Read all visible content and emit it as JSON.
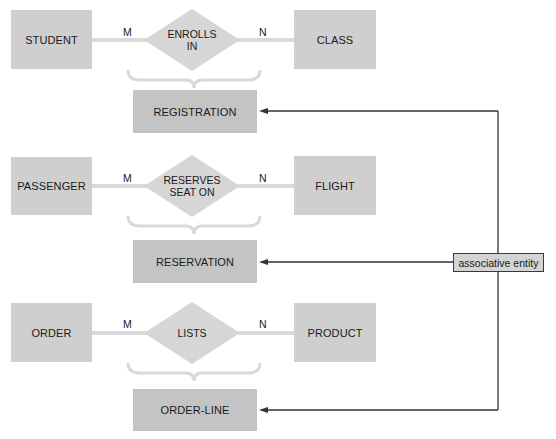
{
  "diagram": {
    "type": "ER diagram - associative entities",
    "rows": [
      {
        "left_entity": "STUDENT",
        "relationship": [
          "ENROLLS",
          "IN"
        ],
        "right_entity": "CLASS",
        "left_cardinality": "M",
        "right_cardinality": "N",
        "associative_entity": "REGISTRATION"
      },
      {
        "left_entity": "PASSENGER",
        "relationship": [
          "RESERVES",
          "SEAT ON"
        ],
        "right_entity": "FLIGHT",
        "left_cardinality": "M",
        "right_cardinality": "N",
        "associative_entity": "RESERVATION"
      },
      {
        "left_entity": "ORDER",
        "relationship": [
          "LISTS"
        ],
        "right_entity": "PRODUCT",
        "left_cardinality": "M",
        "right_cardinality": "N",
        "associative_entity": "ORDER-LINE"
      }
    ],
    "callout": "associative entity",
    "colors": {
      "entity_fill": "#cfcfcf",
      "relationship_fill": "#d6d6d6",
      "connector": "#d9d9d9",
      "arrow": "#333333"
    }
  }
}
